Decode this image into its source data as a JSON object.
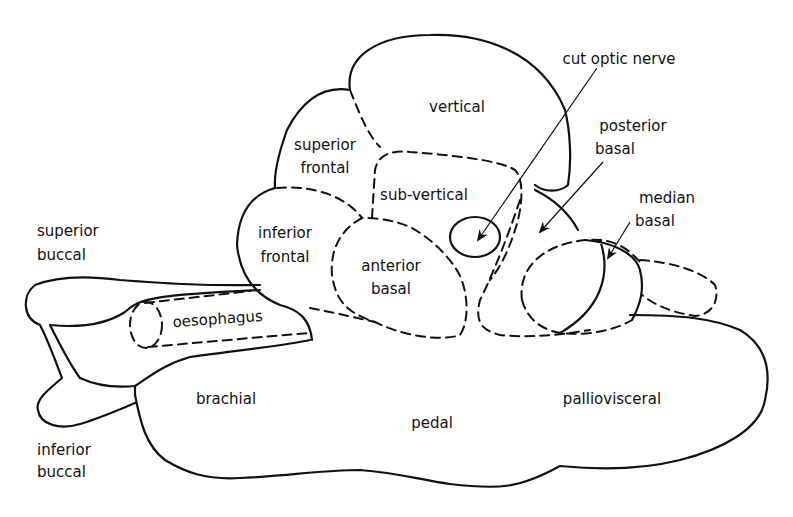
{
  "diagram": {
    "type": "anatomical lobe diagram",
    "labels": {
      "vertical": "vertical",
      "superior_frontal_1": "superior",
      "superior_frontal_2": "frontal",
      "inferior_frontal_1": "inferior",
      "inferior_frontal_2": "frontal",
      "sub_vertical": "sub-vertical",
      "anterior_basal_1": "anterior",
      "anterior_basal_2": "basal",
      "cut_optic_nerve": "cut optic nerve",
      "posterior_basal_1": "posterior",
      "posterior_basal_2": "basal",
      "median_basal_1": "median",
      "median_basal_2": "basal",
      "superior_buccal_1": "superior",
      "superior_buccal_2": "buccal",
      "inferior_buccal_1": "inferior",
      "inferior_buccal_2": "buccal",
      "oesophagus": "oesophagus",
      "brachial": "brachial",
      "pedal": "pedal",
      "palliovisceral": "palliovisceral"
    },
    "colors": {
      "line": "#111111",
      "background": "#ffffff"
    }
  }
}
